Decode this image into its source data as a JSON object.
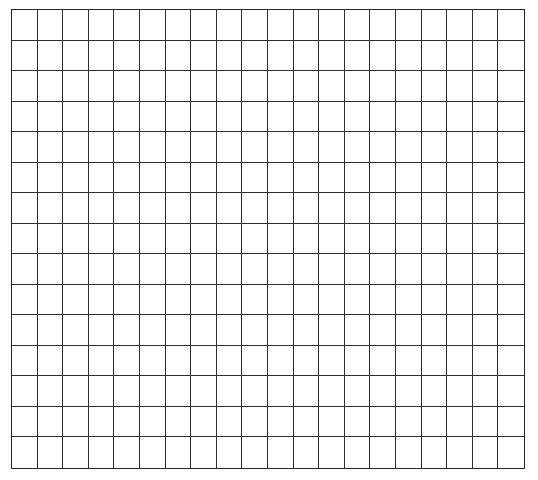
{
  "grid": {
    "columns": 20,
    "rows": 15,
    "line_color": "#2e2e2e",
    "background": "#ffffff"
  },
  "caption": {
    "text": ""
  }
}
